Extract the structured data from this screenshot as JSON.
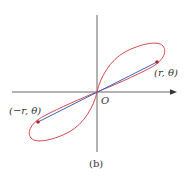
{
  "diagram": {
    "caption": "(b)",
    "origin_label": "O",
    "point_positive": {
      "label": "(r, θ)",
      "x": 157,
      "y": 62
    },
    "point_negative": {
      "label": "(−r, θ)",
      "x": 38,
      "y": 122
    },
    "axes": {
      "x_axis": {
        "x1": 12,
        "x2": 176,
        "y": 92,
        "arrow": "right"
      },
      "y_axis": {
        "x": 97,
        "y1": 15,
        "y2": 152
      }
    },
    "curve": {
      "type": "lemniscate-like loop through origin",
      "color": "#d9474f"
    },
    "segment": {
      "from": "(−r, θ)",
      "to": "(r, θ)",
      "through": "O",
      "color": "#3a66b8"
    },
    "colors": {
      "axis": "#555555",
      "curve": "#d9474f",
      "segment": "#3a66b8",
      "point": "#b3262e",
      "text": "#333333"
    }
  }
}
